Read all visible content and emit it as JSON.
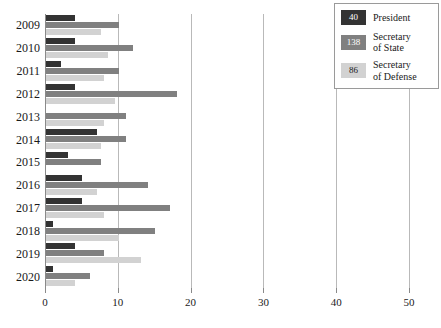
{
  "chart_data": {
    "type": "bar",
    "orientation": "horizontal",
    "title": "",
    "xlabel": "",
    "ylabel": "",
    "xlim": [
      0,
      50
    ],
    "xticks": [
      0,
      10,
      20,
      30,
      40,
      50
    ],
    "xtick_labels": [
      "0",
      "10",
      "20",
      "30",
      "40",
      "50"
    ],
    "grid": true,
    "legend_position": "top-right",
    "categories": [
      "2009",
      "2010",
      "2011",
      "2012",
      "2013",
      "2014",
      "2015",
      "2016",
      "2017",
      "2018",
      "2019",
      "2020"
    ],
    "series": [
      {
        "name": "President",
        "total": "40",
        "color": "#333333",
        "values": [
          4.0,
          4.0,
          2.0,
          4.0,
          0.0,
          7.0,
          3.0,
          5.0,
          5.0,
          1.0,
          4.0,
          1.0
        ]
      },
      {
        "name": "Secretary of State",
        "total": "138",
        "color": "#808080",
        "values": [
          10.0,
          12.0,
          10.0,
          18.0,
          11.0,
          11.0,
          7.5,
          14.0,
          17.0,
          15.0,
          8.0,
          6.0
        ]
      },
      {
        "name": "Secretary of Defense",
        "total": "86",
        "color": "#d2d2d2",
        "values": [
          7.5,
          8.5,
          8.0,
          9.5,
          8.0,
          7.5,
          0.0,
          7.0,
          8.0,
          10.0,
          13.0,
          4.0
        ]
      }
    ]
  },
  "legend": {
    "entries": [
      {
        "badge": "40",
        "line1": "President",
        "line2": ""
      },
      {
        "badge": "138",
        "line1": "Secretary",
        "line2": "of State"
      },
      {
        "badge": "86",
        "line1": "Secretary",
        "line2": "of Defense"
      }
    ]
  },
  "colors": {
    "president": "#333333",
    "secretary_of_state": "#808080",
    "secretary_of_defense": "#d2d2d2",
    "gridline": "#b9b9b9",
    "axis": "#8a8a8a",
    "text": "#1a1a1a",
    "background": "#ffffff"
  }
}
